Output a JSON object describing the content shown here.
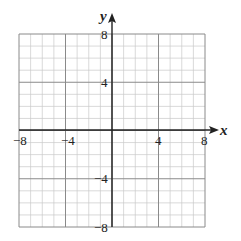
{
  "chart_data": {
    "type": "scatter",
    "title": "",
    "xlabel": "x",
    "ylabel": "y",
    "xlim": [
      -8,
      8
    ],
    "ylim": [
      -8,
      8
    ],
    "grid": true,
    "grid_minor_step": 1,
    "grid_major_step": 4,
    "x_ticks": [
      -8,
      -4,
      4,
      8
    ],
    "y_ticks": [
      8,
      4,
      -4,
      -8
    ],
    "x_tick_labels": [
      "−8",
      "−4",
      "4",
      "8"
    ],
    "y_tick_labels": [
      "8",
      "4",
      "−4",
      "−8"
    ],
    "series": [],
    "legend": null
  },
  "axes": {
    "x_label": "x",
    "y_label": "y"
  },
  "colors": {
    "minor_grid": "#c8c8c8",
    "major_grid": "#8a8a8a",
    "axis": "#222222",
    "background": "#ffffff"
  }
}
